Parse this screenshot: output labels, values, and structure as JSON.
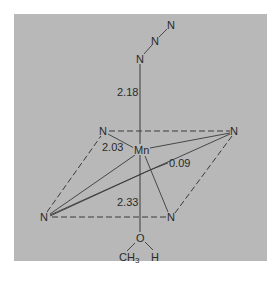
{
  "figure": {
    "type": "molecular-geometry-diagram",
    "background_color": "#b8b8b8",
    "line_color": "#3a3a3a",
    "center_atom": "Mn",
    "azide": {
      "atoms": [
        "N",
        "N",
        "N"
      ]
    },
    "equatorial_atoms": {
      "top_left": "N",
      "top_right": "N",
      "bottom_left": "N",
      "bottom_right": "N"
    },
    "axial_ligand": {
      "oxygen": "O",
      "methyl": "CH",
      "methyl_sub": "3",
      "hydrogen": "H"
    },
    "distances": {
      "mn_azide": "2.18",
      "mn_equatorial": "2.03",
      "displacement": "0.09",
      "mn_oxygen": "2.33"
    }
  }
}
